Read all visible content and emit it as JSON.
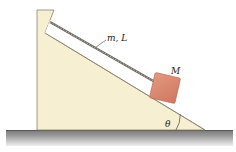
{
  "diagram": {
    "labels": {
      "rope": "m, L",
      "block": "M",
      "angle": "θ"
    },
    "colors": {
      "wedge": "#f7efd2",
      "wedge_edge": "#8a8070",
      "block": "#d9846a",
      "block_edge": "#b5644c",
      "ground_top": "#777777",
      "ground_bottom": "#e6e6e6",
      "rope": "#6e6a62"
    }
  }
}
